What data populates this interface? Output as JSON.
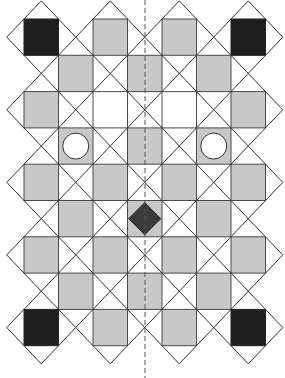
{
  "diagram": {
    "grid": {
      "cols": 7,
      "rows": 9,
      "origin_x": 24,
      "origin_y": 19,
      "cell_w": 34.5,
      "cell_h": 36.3
    },
    "colors": {
      "gray": "#c8c8c8",
      "black": "#1e1e1e",
      "white": "#ffffff",
      "line": "#333333",
      "diamond": "#3a3a3a"
    },
    "squares": [
      {
        "r": 0,
        "c": 0,
        "fill": "black"
      },
      {
        "r": 0,
        "c": 2,
        "fill": "gray"
      },
      {
        "r": 0,
        "c": 4,
        "fill": "gray"
      },
      {
        "r": 0,
        "c": 6,
        "fill": "black"
      },
      {
        "r": 1,
        "c": 1,
        "fill": "gray"
      },
      {
        "r": 1,
        "c": 3,
        "fill": "gray"
      },
      {
        "r": 1,
        "c": 5,
        "fill": "gray"
      },
      {
        "r": 2,
        "c": 0,
        "fill": "gray"
      },
      {
        "r": 2,
        "c": 2,
        "fill": "white"
      },
      {
        "r": 2,
        "c": 4,
        "fill": "white"
      },
      {
        "r": 2,
        "c": 6,
        "fill": "gray"
      },
      {
        "r": 3,
        "c": 1,
        "fill": "gray",
        "mark": "circle"
      },
      {
        "r": 3,
        "c": 3,
        "fill": "gray"
      },
      {
        "r": 3,
        "c": 5,
        "fill": "gray",
        "mark": "circle"
      },
      {
        "r": 4,
        "c": 0,
        "fill": "gray"
      },
      {
        "r": 4,
        "c": 2,
        "fill": "gray"
      },
      {
        "r": 4,
        "c": 4,
        "fill": "gray"
      },
      {
        "r": 4,
        "c": 6,
        "fill": "gray"
      },
      {
        "r": 5,
        "c": 1,
        "fill": "gray"
      },
      {
        "r": 5,
        "c": 3,
        "fill": "gray",
        "mark": "diamond"
      },
      {
        "r": 5,
        "c": 5,
        "fill": "gray"
      },
      {
        "r": 6,
        "c": 0,
        "fill": "gray"
      },
      {
        "r": 6,
        "c": 2,
        "fill": "gray"
      },
      {
        "r": 6,
        "c": 4,
        "fill": "gray"
      },
      {
        "r": 6,
        "c": 6,
        "fill": "gray"
      },
      {
        "r": 7,
        "c": 1,
        "fill": "gray"
      },
      {
        "r": 7,
        "c": 3,
        "fill": "gray"
      },
      {
        "r": 7,
        "c": 5,
        "fill": "gray"
      },
      {
        "r": 8,
        "c": 0,
        "fill": "black"
      },
      {
        "r": 8,
        "c": 2,
        "fill": "gray"
      },
      {
        "r": 8,
        "c": 4,
        "fill": "gray"
      },
      {
        "r": 8,
        "c": 6,
        "fill": "black"
      }
    ],
    "symmetry_axis": {
      "x": 145,
      "style": "dashed"
    }
  }
}
